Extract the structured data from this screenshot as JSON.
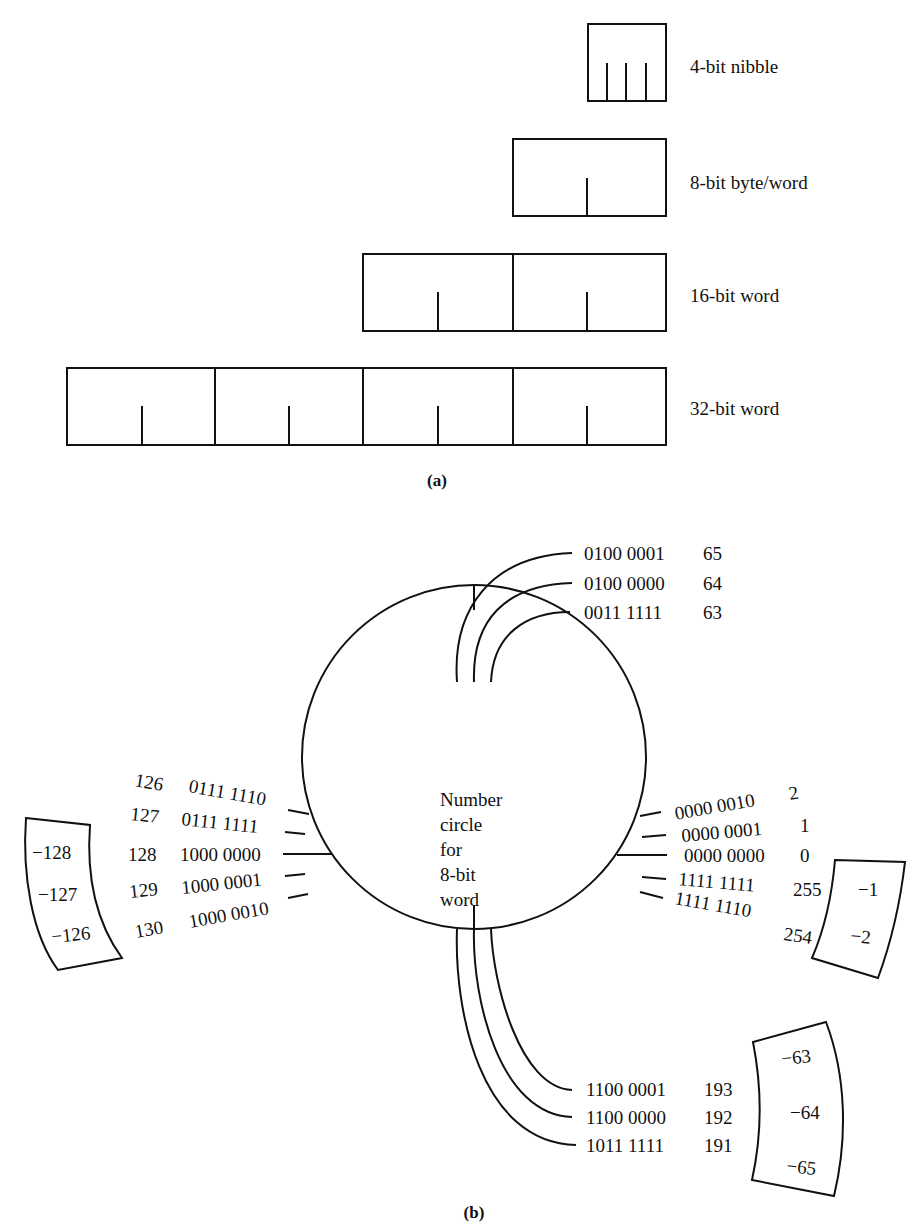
{
  "part_a": {
    "caption": "(a)",
    "rows": [
      {
        "label": "4-bit nibble",
        "bits": 4
      },
      {
        "label": "8-bit byte/word",
        "bits": 8
      },
      {
        "label": "16-bit word",
        "bits": 16
      },
      {
        "label": "32-bit word",
        "bits": 32
      }
    ]
  },
  "part_b": {
    "caption": "(b)",
    "center_text": [
      "Number",
      "circle",
      "for",
      "8-bit",
      "word"
    ],
    "top": [
      {
        "binary": "0100 0001",
        "decimal": "65"
      },
      {
        "binary": "0100 0000",
        "decimal": "64"
      },
      {
        "binary": "0011 1111",
        "decimal": "63"
      }
    ],
    "left": [
      {
        "decimal": "126",
        "binary": "0111 1110"
      },
      {
        "decimal": "127",
        "binary": "0111 1111"
      },
      {
        "decimal": "128",
        "binary": "1000 0000"
      },
      {
        "decimal": "129",
        "binary": "1000 0001"
      },
      {
        "decimal": "130",
        "binary": "1000 0010"
      }
    ],
    "left_signed": [
      "−128",
      "−127",
      "−126"
    ],
    "right": [
      {
        "binary": "0000 0010",
        "decimal": "2"
      },
      {
        "binary": "0000 0001",
        "decimal": "1"
      },
      {
        "binary": "0000 0000",
        "decimal": "0"
      },
      {
        "binary": "1111 1111",
        "decimal": "255"
      },
      {
        "binary": "1111 1110",
        "decimal": "254"
      }
    ],
    "right_signed": [
      "−1",
      "−2"
    ],
    "bottom": [
      {
        "binary": "1100 0001",
        "decimal": "193"
      },
      {
        "binary": "1100 0000",
        "decimal": "192"
      },
      {
        "binary": "1011 1111",
        "decimal": "191"
      }
    ],
    "bottom_signed": [
      "−63",
      "−64",
      "−65"
    ]
  }
}
